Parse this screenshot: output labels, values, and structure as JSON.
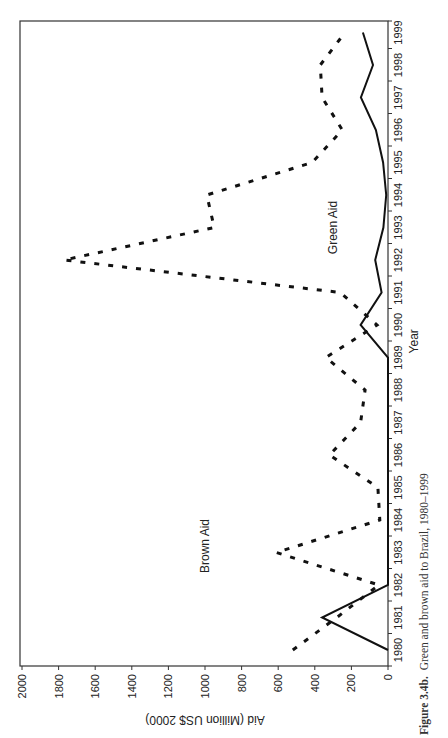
{
  "figure": {
    "caption_label": "Figure 3.4b.",
    "caption_text": "Green and brown aid to Brazil, 1980–1999"
  },
  "chart_data": {
    "type": "line",
    "title": "Green and brown aid to Brazil, 1980–1999",
    "xlabel": "Year",
    "ylabel": "Aid (Million US$ 2000)",
    "orientation": "rotated 90° counter-clockwise (year axis on right, aid axis along bottom)",
    "x": [
      1980,
      1981,
      1982,
      1983,
      1984,
      1985,
      1986,
      1987,
      1988,
      1989,
      1990,
      1991,
      1992,
      1993,
      1994,
      1995,
      1996,
      1997,
      1998,
      1999
    ],
    "series": [
      {
        "name": "Brown Aid",
        "style": "dashed",
        "values": [
          520,
          280,
          50,
          610,
          45,
          55,
          320,
          150,
          125,
          340,
          60,
          260,
          1770,
          950,
          990,
          415,
          250,
          360,
          370,
          235
        ]
      },
      {
        "name": "Green Aid",
        "style": "solid",
        "values": [
          0,
          360,
          0,
          0,
          0,
          0,
          0,
          0,
          0,
          0,
          150,
          35,
          70,
          25,
          10,
          27,
          66,
          148,
          82,
          137
        ]
      }
    ],
    "ylim": [
      0,
      2000
    ],
    "yticks": [
      0,
      200,
      400,
      600,
      800,
      1000,
      1200,
      1400,
      1600,
      1800,
      2000
    ],
    "xticks": [
      1980,
      1981,
      1982,
      1983,
      1984,
      1985,
      1986,
      1987,
      1988,
      1989,
      1990,
      1991,
      1992,
      1993,
      1994,
      1995,
      1996,
      1997,
      1998,
      1999
    ],
    "grid": false,
    "annotations": [
      {
        "text": "Brown Aid",
        "year": 1983.2,
        "value": 980
      },
      {
        "text": "Green Aid",
        "year": 1993,
        "value": 280
      }
    ]
  }
}
